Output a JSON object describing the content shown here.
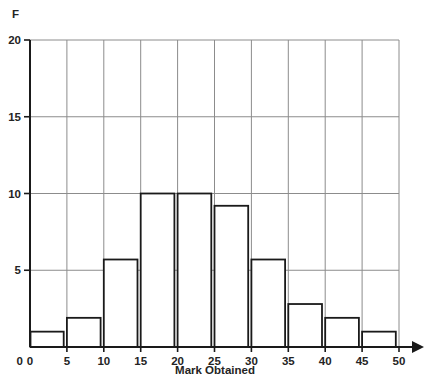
{
  "chart_data": {
    "type": "bar",
    "title": "",
    "subtitle": "",
    "xlabel": "Mark Obtained",
    "ylabel": "F",
    "categories": [
      "0-5",
      "5-10",
      "10-15",
      "15-20",
      "20-25",
      "25-30",
      "30-35",
      "35-40",
      "40-45",
      "45-50"
    ],
    "bin_edges": [
      0,
      5,
      10,
      15,
      20,
      25,
      30,
      35,
      40,
      45,
      50
    ],
    "values": [
      1.0,
      1.9,
      5.7,
      10.0,
      10.0,
      9.2,
      5.7,
      2.8,
      1.9,
      1.0
    ],
    "xlim": [
      0,
      50
    ],
    "ylim": [
      0,
      20
    ],
    "xticks": [
      0,
      5,
      10,
      15,
      20,
      25,
      30,
      35,
      40,
      45,
      50
    ],
    "xtick_labels": [
      "0",
      "5",
      "10",
      "15",
      "20",
      "25",
      "30",
      "35",
      "40",
      "45",
      "50"
    ],
    "yticks": [
      0,
      5,
      10,
      15,
      20
    ],
    "ytick_labels": [
      "0",
      "5",
      "10",
      "15",
      "20"
    ],
    "grid": true,
    "grid_axis": "both",
    "legend": false,
    "legend_position": "none",
    "bar_fill": "#ffffff",
    "bar_stroke": "#1a1a1a",
    "grid_color": "#8c8c8c",
    "axis_color": "#1a1a1a",
    "text_color": "#242424",
    "background": "#ffffff",
    "annotations": []
  },
  "axes": {
    "y_label_text": "F",
    "x_label_text": "Mark Obtained",
    "x_arrow": true,
    "y_arrow": false
  }
}
